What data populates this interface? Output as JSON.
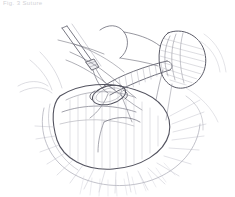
{
  "canvas": {
    "width": 235,
    "height": 197,
    "background": "#ffffff"
  },
  "caption": {
    "text": "Fig. 3  Suture",
    "color": "#d2d2d6"
  },
  "figure": {
    "technique": "line-art",
    "ink_color": "#5a5a66",
    "ink_light": "#9a9aa6",
    "ink_faint": "#c4c4cc",
    "ink_hatch": "#b0b0bb",
    "parts": [
      {
        "name": "surgical-needle",
        "label": "needle"
      },
      {
        "name": "suture-thread",
        "label": "suture"
      },
      {
        "name": "ligature-loop",
        "label": "ligature loop"
      },
      {
        "name": "great-vessel",
        "label": "great vessel"
      },
      {
        "name": "atrial-appendage",
        "label": "atrial appendage"
      },
      {
        "name": "ventricle-body",
        "label": "ventricle"
      },
      {
        "name": "epicardial-fat",
        "label": "epicardial fat"
      },
      {
        "name": "pericardial-hatching",
        "label": "pericardium"
      }
    ]
  }
}
